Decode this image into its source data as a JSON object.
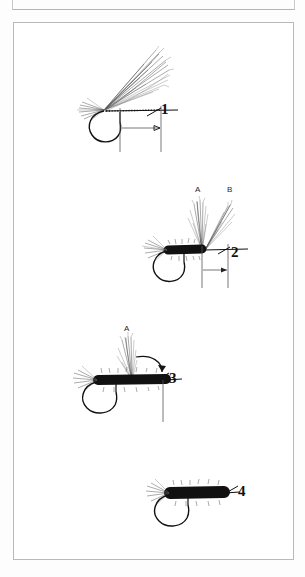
{
  "page": {
    "type": "illustration-plate",
    "background_color": "#ffffff",
    "border_color": "#b9b9b9",
    "ink_color": "#111111"
  },
  "figures": [
    {
      "number": "1",
      "caption_number": "1",
      "description": "Hair wing tied in at hook eye, thread wraps and measuring arrow",
      "labels": []
    },
    {
      "number": "2",
      "caption_number": "2",
      "description": "Dubbed body tied, wing split into two sections A and B",
      "labels": [
        "A",
        "B"
      ]
    },
    {
      "number": "3",
      "caption_number": "3",
      "description": "Single upright wing A folded forward, curved arrow shows direction",
      "labels": [
        "A"
      ]
    },
    {
      "number": "4",
      "caption_number": "4",
      "description": "Finished fly with dubbed body and tail",
      "labels": []
    }
  ],
  "labels": {
    "fig1_number": "1",
    "fig2_number": "2",
    "fig2_a": "A",
    "fig2_b": "B",
    "fig3_number": "3",
    "fig3_a": "A",
    "fig4_number": "4"
  }
}
